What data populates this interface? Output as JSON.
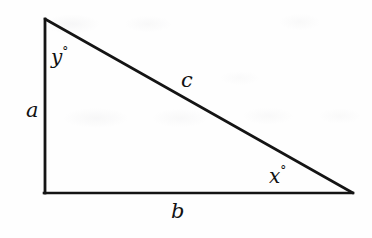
{
  "figure": {
    "type": "right-triangle-diagram",
    "background_color": "#fefefe",
    "stroke_color": "#141414",
    "text_color": "#111111",
    "stroke_width": 2.6,
    "vertices": {
      "top": {
        "x": 45,
        "y": 19
      },
      "bottom_left": {
        "x": 45,
        "y": 193
      },
      "bottom_right": {
        "x": 353,
        "y": 193
      }
    },
    "labels": {
      "side_a": "a",
      "side_b": "b",
      "side_c": "c",
      "angle_y": "y",
      "angle_x": "x",
      "degree_symbol": "°"
    }
  }
}
